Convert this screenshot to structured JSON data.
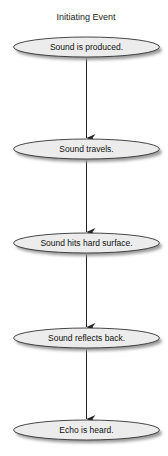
{
  "diagram": {
    "title": "Initiating Event",
    "nodes": [
      {
        "id": "n1",
        "label": "Sound is produced."
      },
      {
        "id": "n2",
        "label": "Sound travels."
      },
      {
        "id": "n3",
        "label": "Sound hits hard surface."
      },
      {
        "id": "n4",
        "label": "Sound reflects back."
      },
      {
        "id": "n5",
        "label": "Echo is heard."
      }
    ],
    "edges": [
      {
        "from": "n1",
        "to": "n2"
      },
      {
        "from": "n2",
        "to": "n3"
      },
      {
        "from": "n3",
        "to": "n4"
      },
      {
        "from": "n4",
        "to": "n5"
      }
    ],
    "colors": {
      "node_fill": "#ececec",
      "node_stroke": "#333333",
      "shadow": "#9a9a9a",
      "edge": "#222222",
      "text": "#111111"
    }
  }
}
